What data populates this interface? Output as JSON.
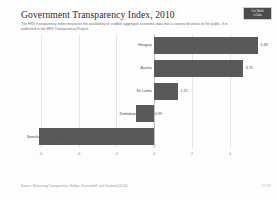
{
  "header": {
    "title": "Government Transparency Index, 2010",
    "subtitle": "The HRV transparency index measures the availability of credible aggregate economic data that a country discloses to the public. It is published in the HRV Transparency Project.",
    "badge_line1": "Our World",
    "badge_line2": "in Data"
  },
  "footer": {
    "source": "Source: Measuring Transparency: Hollyer, Rosendorff, and Vreeland (2014)",
    "credit": "CC BY"
  },
  "colors": {
    "bar": "#595959",
    "zero_axis": "#c2c2c2",
    "gridline": "#e6e6e6"
  },
  "chart_data": {
    "type": "bar",
    "orientation": "horizontal",
    "title": "Government Transparency Index, 2010",
    "xlabel": "",
    "ylabel": "",
    "xlim": [
      -7.2,
      5.8
    ],
    "ticks": [
      "-6",
      "-4",
      "-2",
      "0",
      "2",
      "4"
    ],
    "tick_values": [
      -6,
      -4,
      -2,
      0,
      2,
      4
    ],
    "grid": true,
    "categories": [
      "Hungary",
      "Austria",
      "Sri Lanka",
      "Zimbabwe",
      "Somalia"
    ],
    "values": [
      5.48,
      4.7,
      1.25,
      -0.99,
      -6.08
    ],
    "value_labels": [
      "5.48",
      "4.70",
      "1.25",
      "-0.99",
      "-6.08"
    ]
  }
}
